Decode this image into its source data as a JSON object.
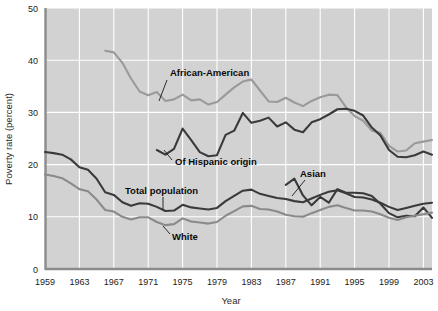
{
  "chart_data": {
    "type": "line",
    "title": "",
    "xlabel": "Year",
    "ylabel": "Poverty rate (percent)",
    "xlim": [
      1959,
      2004
    ],
    "ylim": [
      0,
      50
    ],
    "yticks": [
      0,
      10,
      20,
      30,
      40,
      50
    ],
    "xticks": [
      1959,
      1963,
      1967,
      1971,
      1975,
      1979,
      1983,
      1987,
      1991,
      1995,
      1999,
      2003
    ],
    "grid": true,
    "legend_position": "inline-annotations",
    "plot_background": "#d2d2d2",
    "series": [
      {
        "name": "African-American",
        "color": "#9a9a9a",
        "label_x": 1974,
        "label_y": 38.2,
        "x": [
          1966,
          1967,
          1968,
          1969,
          1970,
          1971,
          1972,
          1973,
          1974,
          1975,
          1976,
          1977,
          1978,
          1979,
          1980,
          1981,
          1982,
          1983,
          1984,
          1985,
          1986,
          1987,
          1988,
          1989,
          1990,
          1991,
          1992,
          1993,
          1994,
          1995,
          1996,
          1997,
          1998,
          1999,
          2000,
          2001,
          2002,
          2003,
          2004
        ],
        "values": [
          41.8,
          41.5,
          39.5,
          36.5,
          34.0,
          33.3,
          33.9,
          32.2,
          32.5,
          33.4,
          32.3,
          32.5,
          31.5,
          32.0,
          33.4,
          34.8,
          35.9,
          36.3,
          34.2,
          32.1,
          32.0,
          32.8,
          31.9,
          31.2,
          32.2,
          32.9,
          33.4,
          33.3,
          31.0,
          29.3,
          28.4,
          26.5,
          26.1,
          23.6,
          22.5,
          22.7,
          24.1,
          24.4,
          24.7
        ]
      },
      {
        "name": "Of Hispanic origin",
        "color": "#3a3a3a",
        "label_x": 1975,
        "label_y": 20.0,
        "x": [
          1972,
          1973,
          1974,
          1975,
          1976,
          1977,
          1978,
          1979,
          1980,
          1981,
          1982,
          1983,
          1984,
          1985,
          1986,
          1987,
          1988,
          1989,
          1990,
          1991,
          1992,
          1993,
          1994,
          1995,
          1996,
          1997,
          1998,
          1999,
          2000,
          2001,
          2002,
          2003,
          2004
        ],
        "values": [
          22.8,
          21.9,
          23.0,
          26.9,
          24.7,
          22.4,
          21.6,
          21.8,
          25.7,
          26.5,
          29.9,
          28.0,
          28.4,
          29.0,
          27.3,
          28.1,
          26.7,
          26.2,
          28.1,
          28.7,
          29.6,
          30.6,
          30.7,
          30.3,
          29.4,
          27.1,
          25.6,
          22.8,
          21.5,
          21.4,
          21.8,
          22.5,
          21.9
        ]
      },
      {
        "name": "Asian",
        "color": "#3a3a3a",
        "label_x": 1990,
        "label_y": 17.2,
        "x": [
          1987,
          1988,
          1989,
          1990,
          1991,
          1992,
          1993,
          1994,
          1995,
          1996,
          1997,
          1998,
          1999,
          2000,
          2001,
          2002,
          2003,
          2004
        ],
        "values": [
          16.1,
          17.3,
          14.1,
          12.2,
          13.8,
          12.7,
          15.3,
          14.6,
          14.6,
          14.5,
          14.0,
          12.5,
          10.7,
          9.9,
          10.2,
          10.1,
          11.8,
          9.8
        ]
      },
      {
        "name": "Total population",
        "color": "#3a3a3a",
        "label_x": 1974,
        "label_y": 15.4,
        "x": [
          1959,
          1960,
          1961,
          1962,
          1963,
          1964,
          1965,
          1966,
          1967,
          1968,
          1969,
          1970,
          1971,
          1972,
          1973,
          1974,
          1975,
          1976,
          1977,
          1978,
          1979,
          1980,
          1981,
          1982,
          1983,
          1984,
          1985,
          1986,
          1987,
          1988,
          1989,
          1990,
          1991,
          1992,
          1993,
          1994,
          1995,
          1996,
          1997,
          1998,
          1999,
          2000,
          2001,
          2002,
          2003,
          2004
        ],
        "values": [
          22.4,
          22.2,
          21.9,
          21.0,
          19.5,
          19.0,
          17.3,
          14.7,
          14.2,
          12.8,
          12.1,
          12.6,
          12.5,
          11.9,
          11.1,
          11.2,
          12.3,
          11.8,
          11.6,
          11.4,
          11.7,
          13.0,
          14.0,
          15.0,
          15.2,
          14.4,
          14.0,
          13.6,
          13.4,
          13.0,
          12.8,
          13.5,
          14.2,
          14.8,
          15.1,
          14.5,
          13.8,
          13.7,
          13.3,
          12.7,
          11.9,
          11.3,
          11.7,
          12.1,
          12.5,
          12.7
        ]
      },
      {
        "name": "White",
        "color": "#8a8a8a",
        "label_x": 1973,
        "label_y": 6.6,
        "x": [
          1959,
          1960,
          1961,
          1962,
          1963,
          1964,
          1965,
          1966,
          1967,
          1968,
          1969,
          1970,
          1971,
          1972,
          1973,
          1974,
          1975,
          1976,
          1977,
          1978,
          1979,
          1980,
          1981,
          1982,
          1983,
          1984,
          1985,
          1986,
          1987,
          1988,
          1989,
          1990,
          1991,
          1992,
          1993,
          1994,
          1995,
          1996,
          1997,
          1998,
          1999,
          2000,
          2001,
          2002,
          2003,
          2004
        ],
        "values": [
          18.1,
          17.8,
          17.4,
          16.4,
          15.3,
          14.9,
          13.3,
          11.3,
          11.0,
          10.0,
          9.5,
          9.9,
          9.9,
          9.0,
          8.4,
          8.6,
          9.7,
          9.1,
          8.9,
          8.7,
          9.0,
          10.2,
          11.1,
          12.0,
          12.1,
          11.5,
          11.4,
          11.0,
          10.4,
          10.1,
          10.0,
          10.7,
          11.3,
          11.9,
          12.2,
          11.7,
          11.2,
          11.2,
          11.0,
          10.5,
          9.8,
          9.4,
          9.9,
          10.2,
          10.5,
          10.8
        ]
      }
    ]
  },
  "axes": {
    "y_title": "Poverty rate (percent)",
    "x_title": "Year",
    "y_tick_labels": [
      "50",
      "40",
      "30",
      "20",
      "10",
      "0"
    ],
    "x_tick_labels": [
      "1959",
      "1963",
      "1967",
      "1971",
      "1975",
      "1979",
      "1983",
      "1987",
      "1991",
      "1995",
      "1999",
      "2003"
    ]
  },
  "annotations": {
    "african_american": "African-American",
    "hispanic": "Of Hispanic origin",
    "asian": "Asian",
    "total_population": "Total population",
    "white": "White"
  }
}
